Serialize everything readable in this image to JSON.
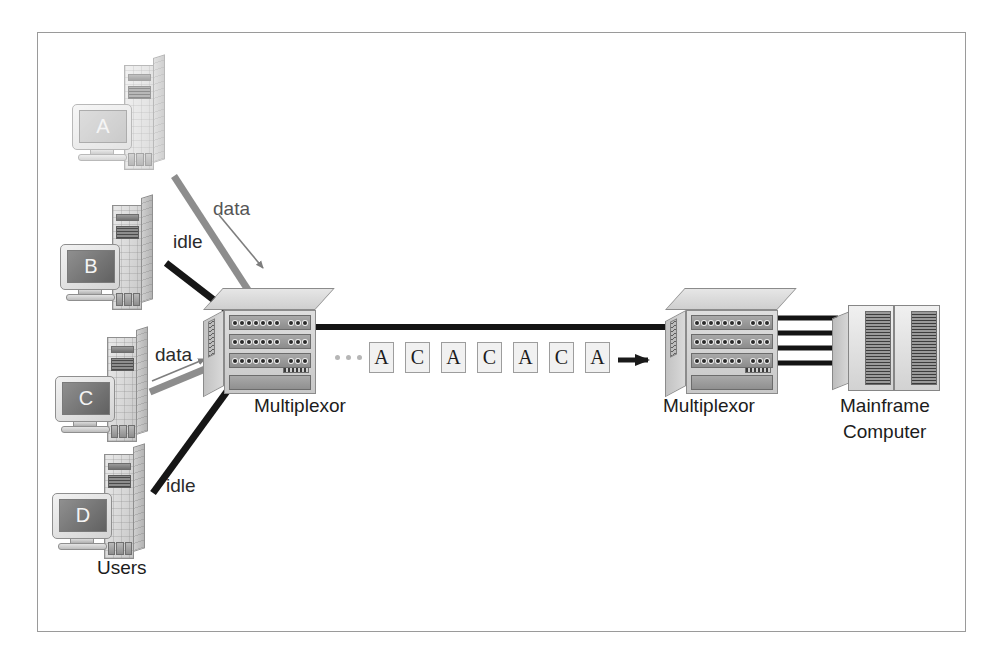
{
  "diagram": {
    "frame_border_color": "#9a9a9a",
    "background": "#ffffff"
  },
  "workstations": [
    {
      "id": "A",
      "screen_label": "A",
      "state": "idle-faded",
      "link_label": "data",
      "link_style": "gray"
    },
    {
      "id": "B",
      "screen_label": "B",
      "state": "active",
      "link_label": "idle",
      "link_style": "black"
    },
    {
      "id": "C",
      "screen_label": "C",
      "state": "active",
      "link_label": "data",
      "link_style": "gray"
    },
    {
      "id": "D",
      "screen_label": "D",
      "state": "active",
      "link_label": "idle",
      "link_style": "black"
    }
  ],
  "labels": {
    "users": "Users",
    "mux_left": "Multiplexor",
    "mux_right": "Multiplexor",
    "mainframe_line1": "Mainframe",
    "mainframe_line2": "Computer",
    "link_a": "data",
    "link_b": "idle",
    "link_c": "data",
    "link_d": "idle"
  },
  "stream": {
    "ellipsis_dots": 3,
    "cells": [
      "A",
      "C",
      "A",
      "C",
      "A",
      "C",
      "A"
    ],
    "direction": "right"
  },
  "mux_ports": {
    "rows": 3,
    "left_group_count": 7,
    "right_group_count": 3
  },
  "trunk": {
    "lines_to_mainframe": 4,
    "trunk_color": "#141414"
  },
  "colors": {
    "ink": "#1c1c1c",
    "gray_link": "#8d8d8d",
    "black_link": "#161616",
    "cell_fill": "#f1f1f1",
    "cell_border": "#9d9d9d"
  }
}
